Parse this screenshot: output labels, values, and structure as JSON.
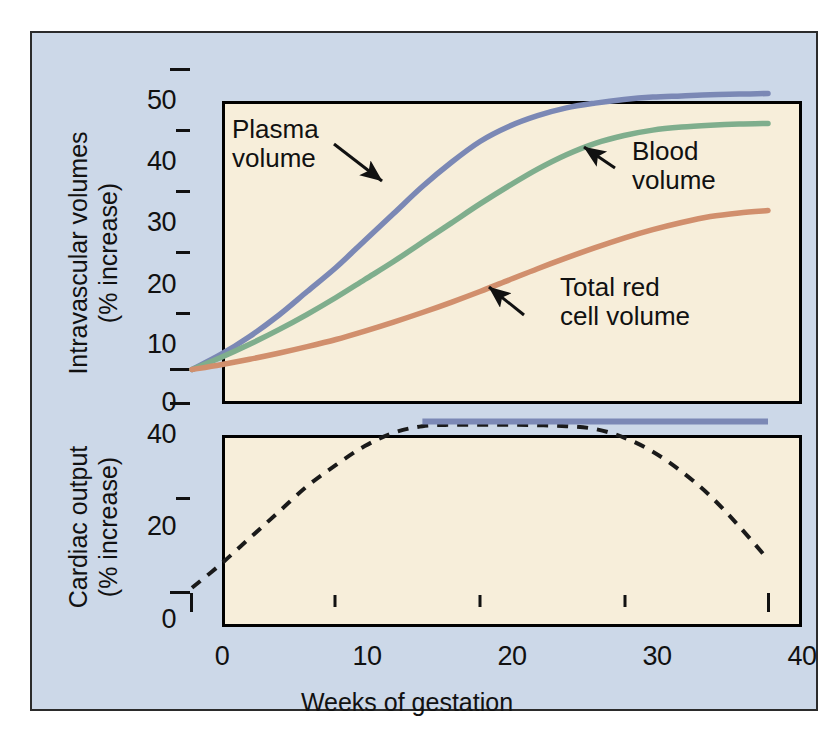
{
  "chart_data": [
    {
      "type": "line",
      "panel": "upper",
      "title": "",
      "xlabel": "Weeks of gestation",
      "ylabel": "Intravascular volumes (% increase)",
      "xlim": [
        0,
        40
      ],
      "ylim": [
        0,
        50
      ],
      "xticks": [
        0,
        10,
        20,
        30,
        40
      ],
      "yticks": [
        0,
        10,
        20,
        30,
        40,
        50
      ],
      "grid": false,
      "legend_position": "inline-annotations",
      "series": [
        {
          "name": "Plasma volume",
          "color": "#7b88b5",
          "style": "solid",
          "x": [
            0,
            2,
            4,
            6,
            8,
            10,
            12,
            14,
            16,
            18,
            20,
            22,
            24,
            26,
            28,
            30,
            32,
            34,
            36,
            38,
            40
          ],
          "values": [
            0,
            2.5,
            5.5,
            9.0,
            13.0,
            17.0,
            21.5,
            26.0,
            30.5,
            34.5,
            38.0,
            40.5,
            42.3,
            43.6,
            44.4,
            45.0,
            45.4,
            45.6,
            45.8,
            45.9,
            46.0
          ]
        },
        {
          "name": "Blood volume",
          "color": "#7fae8d",
          "style": "solid",
          "x": [
            0,
            2,
            4,
            6,
            8,
            10,
            12,
            14,
            16,
            18,
            20,
            22,
            24,
            26,
            28,
            30,
            32,
            34,
            36,
            38,
            40
          ],
          "values": [
            0,
            2.0,
            4.2,
            6.6,
            9.2,
            12.0,
            15.0,
            18.0,
            21.2,
            24.4,
            27.6,
            30.6,
            33.4,
            35.8,
            37.7,
            39.0,
            39.9,
            40.4,
            40.7,
            40.9,
            41.0
          ]
        },
        {
          "name": "Total red cell volume",
          "color": "#d18f6d",
          "style": "solid",
          "x": [
            0,
            2,
            4,
            6,
            8,
            10,
            12,
            14,
            16,
            18,
            20,
            22,
            24,
            26,
            28,
            30,
            32,
            34,
            36,
            38,
            40
          ],
          "values": [
            0,
            0.8,
            1.7,
            2.7,
            3.8,
            5.0,
            6.4,
            7.9,
            9.5,
            11.2,
            13.0,
            14.9,
            16.8,
            18.6,
            20.3,
            21.9,
            23.3,
            24.5,
            25.5,
            26.1,
            26.5
          ]
        }
      ],
      "annotations": [
        {
          "text_line1": "Plasma",
          "text_line2": "volume",
          "arrow": "down-right",
          "points_to_series": "Plasma volume"
        },
        {
          "text_line1": "Blood",
          "text_line2": "volume",
          "arrow": "up-left",
          "points_to_series": "Blood volume"
        },
        {
          "text_line1": "Total red",
          "text_line2": "cell volume",
          "arrow": "up-left",
          "points_to_series": "Total red cell volume"
        }
      ]
    },
    {
      "type": "line",
      "panel": "lower",
      "title": "",
      "xlabel": "Weeks of gestation",
      "ylabel": "Cardiac output (% increase)",
      "xlim": [
        0,
        40
      ],
      "ylim": [
        0,
        40
      ],
      "xticks": [
        0,
        10,
        20,
        30,
        40
      ],
      "yticks": [
        0,
        20,
        40
      ],
      "grid": false,
      "legend_position": "none",
      "series": [
        {
          "name": "Cardiac output (dashed)",
          "color": "#1a1a1a",
          "style": "dashed",
          "x": [
            0,
            2,
            4,
            6,
            8,
            10,
            12,
            14,
            16,
            18,
            20,
            22,
            24,
            26,
            28,
            30,
            32,
            34,
            36,
            38,
            40
          ],
          "values": [
            1.0,
            6.0,
            11.5,
            17.0,
            22.5,
            27.0,
            31.0,
            33.8,
            35.2,
            35.5,
            35.5,
            35.5,
            35.4,
            35.2,
            34.6,
            32.8,
            29.8,
            25.6,
            20.4,
            14.0,
            7.0
          ]
        },
        {
          "name": "Cardiac output plateau",
          "color": "#7b88b5",
          "style": "solid",
          "x": [
            16,
            20,
            24,
            28,
            32,
            36,
            40
          ],
          "values": [
            36.2,
            36.2,
            36.2,
            36.2,
            36.2,
            36.2,
            36.2
          ]
        }
      ],
      "annotations": []
    }
  ],
  "upper": {
    "ylabel_line1": "Intravascular volumes",
    "ylabel_line2": "(% increase)",
    "yticks": [
      "50",
      "40",
      "30",
      "20",
      "10",
      "0"
    ],
    "annotations": {
      "plasma_line1": "Plasma",
      "plasma_line2": "volume",
      "blood_line1": "Blood",
      "blood_line2": "volume",
      "redcell_line1": "Total red",
      "redcell_line2": "cell volume"
    }
  },
  "lower": {
    "ylabel_line1": "Cardiac output",
    "ylabel_line2": "(% increase)",
    "yticks": [
      "40",
      "20",
      "0"
    ]
  },
  "xaxis": {
    "label": "Weeks of gestation",
    "ticks": [
      "0",
      "10",
      "20",
      "30",
      "40"
    ]
  },
  "colors": {
    "plasma": "#7b88b5",
    "blood": "#7fae8d",
    "redcell": "#d18f6d",
    "dashed": "#1a1a1a",
    "panel_bg": "#ccd8e8",
    "plot_bg": "#f7eeda"
  }
}
